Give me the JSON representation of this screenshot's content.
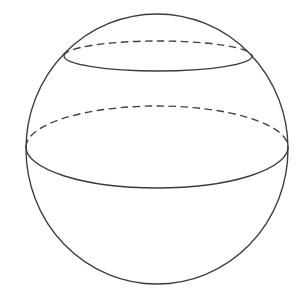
{
  "figure": {
    "caption": "",
    "background_color": "#ffffff",
    "line_color": "#3a3a42",
    "hidden_line_color": "#3f3f47",
    "line_width": 1.35,
    "fill": "none"
  },
  "geometry": {
    "canvas": {
      "width": 305,
      "height": 308
    },
    "sphere_outline": {
      "label": "sphere outline",
      "center": {
        "x": 157,
        "y": 149
      },
      "rx": 131,
      "ry": 135,
      "style": "solid",
      "bounds": {
        "left": 26,
        "right": 288,
        "top": 14,
        "bottom": 284
      },
      "path": "M 26 149 A 131 135 0 1 1 288 149 A 131 135 0 1 1 26 149 Z"
    },
    "cross_sections": [
      {
        "label": "upper cross-section",
        "index": 1,
        "center": {
          "x": 158,
          "y": 56
        },
        "rx": 94,
        "ry": 15,
        "left_endpoint": {
          "x": 64,
          "y": 56
        },
        "right_endpoint": {
          "x": 252,
          "y": 56
        },
        "back_arc": {
          "style": "dashed",
          "visibility": "hidden",
          "apex": {
            "x": 158,
            "y": 41
          },
          "path": "M 64 56 A 94 15 0 0 1 252 56"
        },
        "front_arc": {
          "style": "solid",
          "visibility": "visible",
          "apex": {
            "x": 158,
            "y": 71
          },
          "path": "M 64 56 A 94 15 0 0 0 252 56"
        }
      },
      {
        "label": "lower cross-section",
        "index": 2,
        "center": {
          "x": 157,
          "y": 147
        },
        "rx": 131,
        "ry": 41,
        "left_endpoint": {
          "x": 26,
          "y": 147
        },
        "right_endpoint": {
          "x": 288,
          "y": 147
        },
        "back_arc": {
          "style": "dashed",
          "visibility": "hidden",
          "apex": {
            "x": 157,
            "y": 106
          },
          "path": "M 26 147 A 131 41 0 0 1 288 147"
        },
        "front_arc": {
          "style": "solid",
          "visibility": "visible",
          "apex": {
            "x": 157,
            "y": 188
          },
          "path": "M 26 147 A 131 41 0 0 0 288 147"
        }
      }
    ]
  },
  "labels": {
    "annotations": []
  }
}
